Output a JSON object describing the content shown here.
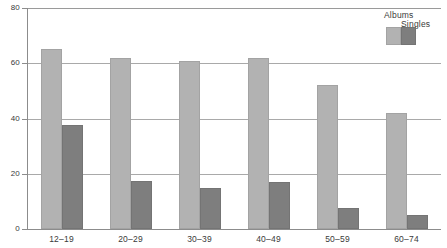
{
  "chart_data": {
    "type": "bar",
    "title": "",
    "subtitle": "",
    "xlabel": "",
    "ylabel": "",
    "categories": [
      "12–19",
      "20–29",
      "30–39",
      "40–49",
      "50–59",
      "60–74"
    ],
    "series": [
      {
        "name": "Albums",
        "color": "#b2b2b2",
        "values": [
          65,
          62,
          61,
          62,
          52,
          42
        ]
      },
      {
        "name": "Singles",
        "color": "#7e7e7e",
        "values": [
          37.5,
          17.5,
          15,
          17,
          7.5,
          5
        ]
      }
    ],
    "ylim": [
      0,
      80
    ],
    "yticks": [
      0,
      20,
      40,
      60,
      80
    ],
    "ytick_labels": [
      "0",
      "20",
      "40",
      "60",
      "80"
    ],
    "grid": "horizontal",
    "legend_position": "top-right",
    "legend_entries": [
      "Albums",
      "Singles"
    ],
    "annotations": []
  }
}
